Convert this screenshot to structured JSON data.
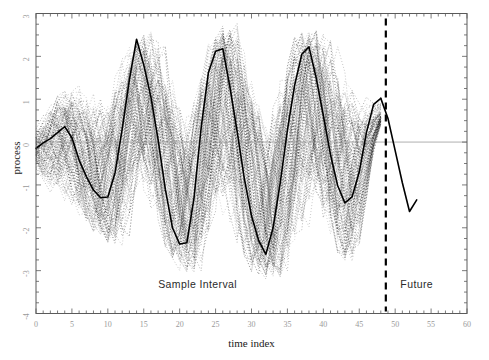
{
  "chart_data": {
    "type": "line",
    "title": "",
    "xlabel": "time index",
    "ylabel": "process",
    "xlim": [
      0,
      60
    ],
    "ylim": [
      -4,
      3
    ],
    "grid": false,
    "legend_position": "none",
    "x_ticks": [
      0,
      5,
      10,
      15,
      20,
      25,
      30,
      35,
      40,
      45,
      50,
      55,
      60
    ],
    "x_tick_labels": [
      "0",
      "5",
      "10",
      "15",
      "20",
      "25",
      "30",
      "35",
      "40",
      "45",
      "50",
      "55",
      "60"
    ],
    "x_minor_tick_step": 1,
    "y_ticks": [
      -4,
      -3,
      -2,
      -1,
      0,
      1,
      2,
      3
    ],
    "y_tick_labels": [
      "-4",
      "-3",
      "-2",
      "-1",
      "0",
      "1",
      "2",
      "3"
    ],
    "y_minor_tick_step": 0.25,
    "annotations": [
      {
        "name": "sample-interval-label",
        "text": "Sample Interval",
        "x": 22.5,
        "y": -3.4
      },
      {
        "name": "future-label",
        "text": "Future",
        "x": 53.0,
        "y": -3.4
      }
    ],
    "reference_lines": [
      {
        "name": "zero-line",
        "orientation": "horizontal",
        "value": 0,
        "x_start": 0,
        "x_end": 60,
        "color": "#999999",
        "style": "solid",
        "width": 0.8
      },
      {
        "name": "forecast-origin-line",
        "orientation": "vertical",
        "value": 48.7,
        "color": "#000000",
        "style": "dashed",
        "width": 2.2
      }
    ],
    "series": [
      {
        "name": "observed process",
        "role": "observed",
        "color": "#000000",
        "style": "solid",
        "width": 1.6,
        "x": [
          0,
          1,
          2,
          3,
          4,
          5,
          6,
          7,
          8,
          9,
          10,
          11,
          12,
          13,
          14,
          15,
          16,
          17,
          18,
          19,
          20,
          21,
          22,
          23,
          24,
          25,
          26,
          27,
          28,
          29,
          30,
          31,
          32,
          33,
          34,
          35,
          36,
          37,
          38,
          39,
          40,
          41,
          42,
          43,
          44,
          45,
          46,
          47,
          48
        ],
        "values": [
          -0.15,
          -0.02,
          0.08,
          0.22,
          0.36,
          0.1,
          -0.42,
          -0.8,
          -1.12,
          -1.3,
          -1.28,
          -0.72,
          0.3,
          1.45,
          2.4,
          1.8,
          1.05,
          0.05,
          -1.1,
          -2.0,
          -2.38,
          -2.35,
          -1.3,
          0.35,
          1.62,
          2.12,
          2.18,
          1.28,
          0.25,
          -0.85,
          -1.72,
          -2.3,
          -2.62,
          -2.0,
          -0.95,
          0.28,
          1.32,
          2.05,
          2.22,
          1.5,
          0.62,
          -0.3,
          -1.02,
          -1.42,
          -1.28,
          -0.7,
          0.22,
          0.88,
          1.02
        ]
      },
      {
        "name": "forecast",
        "role": "forecast",
        "color": "#000000",
        "style": "solid",
        "width": 1.6,
        "x": [
          48,
          49,
          50,
          51,
          52,
          53
        ],
        "values": [
          1.02,
          0.55,
          -0.2,
          -0.95,
          -1.62,
          -1.35
        ]
      }
    ],
    "ensemble": {
      "name": "simulated sample paths",
      "description": "dotted Monte Carlo realizations forming a dense cloud around the observed process",
      "color": "#111111",
      "style": "dotted",
      "n_paths": 110,
      "band_center_note": "paths oscillate about the observed series and converge near the forecast origin",
      "envelope_x": [
        0,
        4,
        8,
        12,
        16,
        20,
        24,
        28,
        32,
        36,
        40,
        44,
        48
      ],
      "envelope_upper": [
        0.55,
        1.35,
        1.95,
        2.35,
        2.55,
        2.62,
        2.68,
        2.7,
        2.7,
        2.68,
        2.62,
        2.4,
        1.5
      ],
      "envelope_lower": [
        -0.75,
        -1.55,
        -2.15,
        -2.55,
        -2.8,
        -2.95,
        -3.05,
        -3.1,
        -3.12,
        -3.12,
        -3.05,
        -2.85,
        -1.05
      ]
    }
  },
  "axes": {
    "y_title": "process",
    "x_title": "time index"
  },
  "labels": {
    "sample_interval": "Sample Interval",
    "future": "Future"
  },
  "colors": {
    "background": "#ffffff",
    "frame": "#5a5a5a",
    "tick_text": "#9a9a9a",
    "line": "#000000",
    "zero_line": "#999999",
    "cloud": "#111111"
  }
}
